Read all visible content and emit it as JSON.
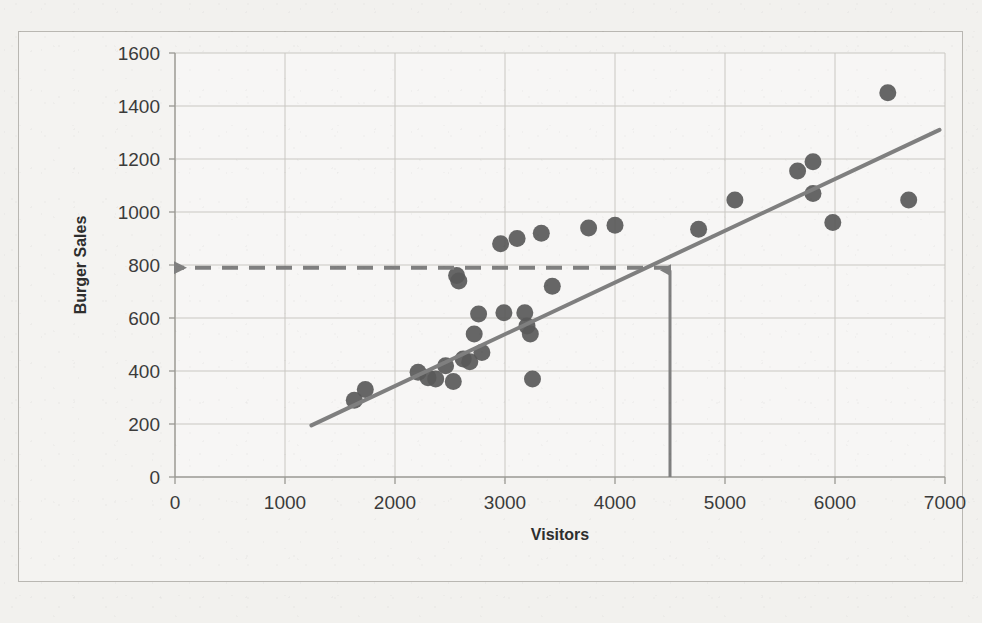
{
  "chart_data": {
    "type": "scatter",
    "title": "",
    "xlabel": "Visitors",
    "ylabel": "Burger Sales",
    "xlim": [
      0,
      7000
    ],
    "ylim": [
      0,
      1600
    ],
    "xticks": [
      "0",
      "1000",
      "2000",
      "3000",
      "4000",
      "5000",
      "6000",
      "7000"
    ],
    "yticks": [
      "0",
      "200",
      "400",
      "600",
      "800",
      "1000",
      "1200",
      "1400",
      "1600"
    ],
    "grid": true,
    "legend": "none",
    "marker_color": "#595959",
    "trendline_color": "#7f7f7f",
    "annotation_color": "#7f7f7f",
    "points": [
      {
        "x": 1630,
        "y": 290
      },
      {
        "x": 1730,
        "y": 330
      },
      {
        "x": 2210,
        "y": 395
      },
      {
        "x": 2300,
        "y": 375
      },
      {
        "x": 2370,
        "y": 370
      },
      {
        "x": 2460,
        "y": 420
      },
      {
        "x": 2530,
        "y": 360
      },
      {
        "x": 2560,
        "y": 760
      },
      {
        "x": 2580,
        "y": 740
      },
      {
        "x": 2620,
        "y": 445
      },
      {
        "x": 2680,
        "y": 435
      },
      {
        "x": 2720,
        "y": 540
      },
      {
        "x": 2760,
        "y": 615
      },
      {
        "x": 2790,
        "y": 470
      },
      {
        "x": 2960,
        "y": 880
      },
      {
        "x": 2990,
        "y": 620
      },
      {
        "x": 3110,
        "y": 900
      },
      {
        "x": 3180,
        "y": 620
      },
      {
        "x": 3200,
        "y": 570
      },
      {
        "x": 3230,
        "y": 540
      },
      {
        "x": 3250,
        "y": 370
      },
      {
        "x": 3330,
        "y": 920
      },
      {
        "x": 3430,
        "y": 720
      },
      {
        "x": 3760,
        "y": 940
      },
      {
        "x": 4000,
        "y": 950
      },
      {
        "x": 4760,
        "y": 935
      },
      {
        "x": 5090,
        "y": 1045
      },
      {
        "x": 5660,
        "y": 1155
      },
      {
        "x": 5800,
        "y": 1190
      },
      {
        "x": 5800,
        "y": 1070
      },
      {
        "x": 5980,
        "y": 960
      },
      {
        "x": 6480,
        "y": 1450
      },
      {
        "x": 6670,
        "y": 1045
      }
    ],
    "trendline": {
      "x0": 1240,
      "y0": 195,
      "x1": 6950,
      "y1": 1310
    },
    "annotations": {
      "vertical_arrow": {
        "x": 4500,
        "y_from": 0,
        "y_to": 780,
        "style": "solid",
        "arrowhead": "up"
      },
      "horizontal_arrow": {
        "y": 790,
        "x_from": 4500,
        "x_to": 0,
        "style": "dashed",
        "arrowhead": "left"
      }
    }
  },
  "page": {
    "bleed_line": "",
    "bleed_line_right": ""
  }
}
